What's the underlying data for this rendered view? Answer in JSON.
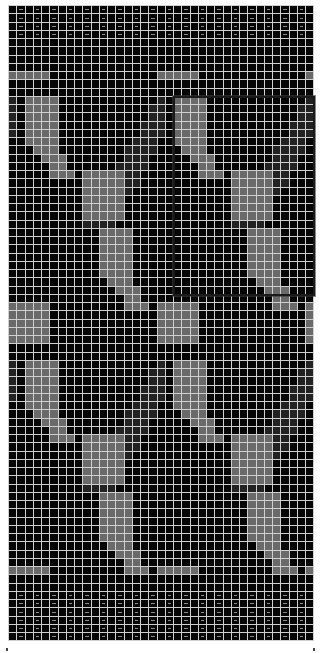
{
  "chart": {
    "columns": 37,
    "rows": 77,
    "cell_size": 7.25,
    "colors": {
      "background": "#050505",
      "gridline": "#cfcfcf",
      "motif_light": "#6a6a6a",
      "motif_mid": "#3a3a3a",
      "motif_dark": "#222222",
      "dash": "#8a8a8a"
    },
    "border_rows_top": 5,
    "border_rows_bottom": 6,
    "dash_every": 2,
    "repeat_cols": 18,
    "repeat_rows": 32,
    "motif_offset_row": 11,
    "selection": {
      "col": 20,
      "row": 11,
      "cols": 17,
      "rows": 24
    }
  },
  "markers": [
    {
      "x": 6
    },
    {
      "x": 313
    }
  ]
}
